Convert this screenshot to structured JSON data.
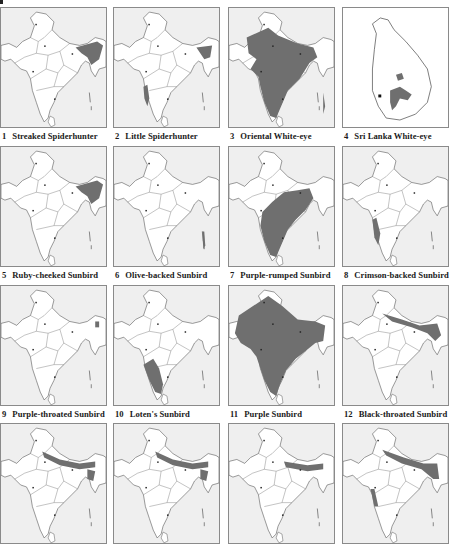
{
  "plate": {
    "title": "PLATE 96"
  },
  "colors": {
    "range_fill": "#6f6f6f",
    "sea": "#efefef",
    "land": "#ffffff",
    "border": "#555555",
    "panel_frame": "#8a8a8a"
  },
  "maps": [
    {
      "num": "1",
      "name": "Streaked Spiderhunter",
      "range": "ne"
    },
    {
      "num": "2",
      "name": "Little Spiderhunter",
      "range": "ne-sw"
    },
    {
      "num": "3",
      "name": "Oriental White-eye",
      "range": "most"
    },
    {
      "num": "4",
      "name": "Sri Lanka White-eye",
      "range": "srilanka"
    },
    {
      "num": "5",
      "name": "Ruby-cheeked Sunbird",
      "range": "ne"
    },
    {
      "num": "6",
      "name": "Olive-backed Sunbird",
      "range": "andaman"
    },
    {
      "num": "7",
      "name": "Purple-rumped Sunbird",
      "range": "peninsula"
    },
    {
      "num": "8",
      "name": "Crimson-backed Sunbird",
      "range": "sw"
    },
    {
      "num": "9",
      "name": "Purple-throated Sunbird",
      "range": "ne-small"
    },
    {
      "num": "10",
      "name": "Loten's Sunbird",
      "range": "south"
    },
    {
      "num": "11",
      "name": "Purple Sunbird",
      "range": "all"
    },
    {
      "num": "12",
      "name": "Black-throated Sunbird",
      "range": "ne-himalaya"
    },
    {
      "num": "",
      "name": "",
      "range": "himalaya"
    },
    {
      "num": "",
      "name": "",
      "range": "himalaya"
    },
    {
      "num": "",
      "name": "",
      "range": "himalaya-spots"
    },
    {
      "num": "",
      "name": "",
      "range": "himalaya-sw"
    }
  ]
}
